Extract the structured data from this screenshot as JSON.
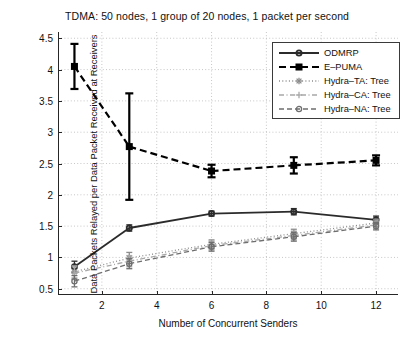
{
  "chart_data": {
    "type": "line",
    "title": "TDMA: 50 nodes, 1 group of 20 nodes, 1 packet per second",
    "xlabel": "Number of Concurrent Senders",
    "ylabel": "Data Packets Relayed per Data Packet Received at Receivers",
    "xlim": [
      0.4,
      12.8
    ],
    "ylim": [
      0.4,
      4.6
    ],
    "xticks": [
      2,
      4,
      6,
      8,
      10,
      12
    ],
    "yticks": [
      0.5,
      1,
      1.5,
      2,
      2.5,
      3,
      3.5,
      4,
      4.5
    ],
    "ytick_labels": [
      "0.5",
      "1",
      "1.5",
      "2",
      "2.5",
      "3",
      "3.5",
      "4",
      "4.5"
    ],
    "xtick_labels": [
      "2",
      "4",
      "6",
      "8",
      "10",
      "12"
    ],
    "grid": true,
    "grid_style": "dotted",
    "legend_position": "upper right",
    "x": [
      1,
      3,
      6,
      9,
      12
    ],
    "series": [
      {
        "name": "ODMRP",
        "color": "#2b2b2b",
        "linestyle": "solid",
        "marker": "circle",
        "values": [
          0.85,
          1.47,
          1.7,
          1.73,
          1.6
        ],
        "yerr": [
          0.09,
          0.05,
          0.04,
          0.05,
          0.06
        ]
      },
      {
        "name": "E-PUMA",
        "color": "#000000",
        "linestyle": "dashed",
        "marker": "square",
        "values": [
          4.05,
          2.77,
          2.38,
          2.47,
          2.55
        ],
        "yerr": [
          0.36,
          0.85,
          0.1,
          0.13,
          0.08
        ]
      },
      {
        "name": "Hydra-TA: Tree",
        "color": "#8c8c8c",
        "linestyle": "dotted",
        "marker": "star",
        "values": [
          0.77,
          0.99,
          1.21,
          1.38,
          1.55
        ],
        "yerr": [
          0.1,
          0.09,
          0.07,
          0.07,
          0.06
        ]
      },
      {
        "name": "Hydra-CA: Tree",
        "color": "#a8a8a8",
        "linestyle": "dashdot",
        "marker": "plus",
        "values": [
          0.75,
          0.94,
          1.19,
          1.35,
          1.52
        ],
        "yerr": [
          0.1,
          0.09,
          0.07,
          0.07,
          0.06
        ]
      },
      {
        "name": "Hydra-NA: Tree",
        "color": "#6e6e6e",
        "linestyle": "dashed",
        "marker": "circle",
        "values": [
          0.62,
          0.9,
          1.17,
          1.33,
          1.5
        ],
        "yerr": [
          0.09,
          0.08,
          0.07,
          0.07,
          0.06
        ]
      }
    ]
  },
  "legend": {
    "items": [
      {
        "label": "ODMRP"
      },
      {
        "label": "E–PUMA"
      },
      {
        "label": "Hydra–TA: Tree"
      },
      {
        "label": "Hydra–CA: Tree"
      },
      {
        "label": "Hydra–NA: Tree"
      }
    ]
  }
}
